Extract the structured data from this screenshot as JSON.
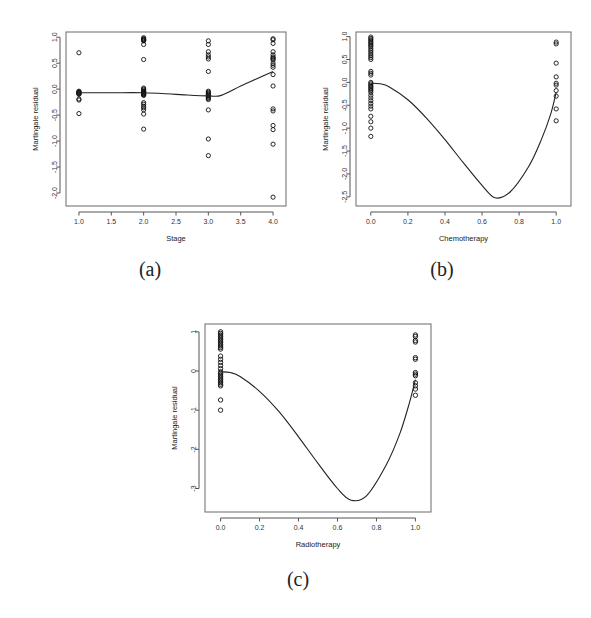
{
  "figure": {
    "background": "#ffffff",
    "panel_captions": [
      "(a)",
      "(b)",
      "(c)"
    ],
    "y_axis_label": "Martingale residual"
  },
  "chart_data": [
    {
      "type": "scatter",
      "panel": "(a)",
      "title": "",
      "xlabel": "Stage",
      "ylabel": "Martingale residual",
      "xlim": [
        0.8,
        4.2
      ],
      "ylim": [
        -2.25,
        1.1
      ],
      "xticks": [
        1.0,
        1.5,
        2.0,
        2.5,
        3.0,
        3.5,
        4.0
      ],
      "xticklabels": [
        "1.0",
        "1.5",
        "2.0",
        "2.5",
        "3.0",
        "3.5",
        "4.0"
      ],
      "yticks": [
        1.0,
        0.5,
        0.0,
        -0.5,
        -1.0,
        -1.5,
        -2.0
      ],
      "yticklabels": [
        "1.0",
        "0.5",
        "0.0",
        "-0.5",
        "-1.0",
        "-1.5",
        "-2.0"
      ],
      "grid": false,
      "legend": "none",
      "points": [
        {
          "x": 1.0,
          "y": 0.7
        },
        {
          "x": 1.0,
          "y": -0.04
        },
        {
          "x": 1.0,
          "y": -0.05
        },
        {
          "x": 1.0,
          "y": -0.06
        },
        {
          "x": 1.0,
          "y": -0.07
        },
        {
          "x": 1.0,
          "y": -0.08
        },
        {
          "x": 1.0,
          "y": -0.09
        },
        {
          "x": 1.0,
          "y": -0.1
        },
        {
          "x": 1.0,
          "y": -0.19
        },
        {
          "x": 1.0,
          "y": -0.21
        },
        {
          "x": 1.0,
          "y": -0.47
        },
        {
          "x": 2.0,
          "y": 0.99
        },
        {
          "x": 2.0,
          "y": 0.97
        },
        {
          "x": 2.0,
          "y": 0.96
        },
        {
          "x": 2.0,
          "y": 0.95
        },
        {
          "x": 2.0,
          "y": 0.94
        },
        {
          "x": 2.0,
          "y": 0.93
        },
        {
          "x": 2.0,
          "y": 0.86
        },
        {
          "x": 2.0,
          "y": 0.57
        },
        {
          "x": 2.0,
          "y": 0.02
        },
        {
          "x": 2.0,
          "y": 0.0
        },
        {
          "x": 2.0,
          "y": -0.02
        },
        {
          "x": 2.0,
          "y": -0.04
        },
        {
          "x": 2.0,
          "y": -0.05
        },
        {
          "x": 2.0,
          "y": -0.06
        },
        {
          "x": 2.0,
          "y": -0.07
        },
        {
          "x": 2.0,
          "y": -0.08
        },
        {
          "x": 2.0,
          "y": -0.09
        },
        {
          "x": 2.0,
          "y": -0.1
        },
        {
          "x": 2.0,
          "y": -0.11
        },
        {
          "x": 2.0,
          "y": -0.12
        },
        {
          "x": 2.0,
          "y": -0.26
        },
        {
          "x": 2.0,
          "y": -0.29
        },
        {
          "x": 2.0,
          "y": -0.33
        },
        {
          "x": 2.0,
          "y": -0.36
        },
        {
          "x": 2.0,
          "y": -0.4
        },
        {
          "x": 2.0,
          "y": -0.48
        },
        {
          "x": 2.0,
          "y": -0.77
        },
        {
          "x": 3.0,
          "y": 0.93
        },
        {
          "x": 3.0,
          "y": 0.86
        },
        {
          "x": 3.0,
          "y": 0.72
        },
        {
          "x": 3.0,
          "y": 0.66
        },
        {
          "x": 3.0,
          "y": 0.62
        },
        {
          "x": 3.0,
          "y": 0.58
        },
        {
          "x": 3.0,
          "y": 0.34
        },
        {
          "x": 3.0,
          "y": -0.04
        },
        {
          "x": 3.0,
          "y": -0.06
        },
        {
          "x": 3.0,
          "y": -0.08
        },
        {
          "x": 3.0,
          "y": -0.1
        },
        {
          "x": 3.0,
          "y": -0.12
        },
        {
          "x": 3.0,
          "y": -0.14
        },
        {
          "x": 3.0,
          "y": -0.16
        },
        {
          "x": 3.0,
          "y": -0.18
        },
        {
          "x": 3.0,
          "y": -0.2
        },
        {
          "x": 3.0,
          "y": -0.4
        },
        {
          "x": 3.0,
          "y": -0.96
        },
        {
          "x": 3.0,
          "y": -1.28
        },
        {
          "x": 4.0,
          "y": 0.97
        },
        {
          "x": 4.0,
          "y": 0.95
        },
        {
          "x": 4.0,
          "y": 0.88
        },
        {
          "x": 4.0,
          "y": 0.72
        },
        {
          "x": 4.0,
          "y": 0.66
        },
        {
          "x": 4.0,
          "y": 0.62
        },
        {
          "x": 4.0,
          "y": 0.6
        },
        {
          "x": 4.0,
          "y": 0.58
        },
        {
          "x": 4.0,
          "y": 0.56
        },
        {
          "x": 4.0,
          "y": 0.5
        },
        {
          "x": 4.0,
          "y": 0.46
        },
        {
          "x": 4.0,
          "y": 0.42
        },
        {
          "x": 4.0,
          "y": 0.28
        },
        {
          "x": 4.0,
          "y": 0.06
        },
        {
          "x": 4.0,
          "y": -0.38
        },
        {
          "x": 4.0,
          "y": -0.42
        },
        {
          "x": 4.0,
          "y": -0.7
        },
        {
          "x": 4.0,
          "y": -0.78
        },
        {
          "x": 4.0,
          "y": -1.06
        },
        {
          "x": 4.0,
          "y": -2.08
        }
      ],
      "smooth_line": [
        {
          "x": 1.0,
          "y": -0.07
        },
        {
          "x": 1.5,
          "y": -0.07
        },
        {
          "x": 2.0,
          "y": -0.07
        },
        {
          "x": 2.5,
          "y": -0.1
        },
        {
          "x": 3.0,
          "y": -0.13
        },
        {
          "x": 3.2,
          "y": -0.12
        },
        {
          "x": 3.5,
          "y": 0.06
        },
        {
          "x": 3.75,
          "y": 0.2
        },
        {
          "x": 4.0,
          "y": 0.34
        }
      ]
    },
    {
      "type": "scatter",
      "panel": "(b)",
      "title": "",
      "xlabel": "Chemotherapy",
      "ylabel": "Martingale residual",
      "xlim": [
        -0.08,
        1.08
      ],
      "ylim": [
        -2.7,
        1.1
      ],
      "xticks": [
        0.0,
        0.2,
        0.4,
        0.6,
        0.8,
        1.0
      ],
      "xticklabels": [
        "0.0",
        "0.2",
        "0.4",
        "0.6",
        "0.8",
        "1.0"
      ],
      "yticks": [
        1.0,
        0.5,
        0.0,
        -0.5,
        -1.0,
        -1.5,
        -2.0,
        -2.5
      ],
      "yticklabels": [
        "1.0",
        "0.5",
        "0.0",
        "-0.5",
        "-1.0",
        "-1.5",
        "-2.0",
        "-2.5"
      ],
      "grid": false,
      "legend": "none",
      "points": [
        {
          "x": 0.0,
          "y": 0.99
        },
        {
          "x": 0.0,
          "y": 0.96
        },
        {
          "x": 0.0,
          "y": 0.93
        },
        {
          "x": 0.0,
          "y": 0.9
        },
        {
          "x": 0.0,
          "y": 0.87
        },
        {
          "x": 0.0,
          "y": 0.84
        },
        {
          "x": 0.0,
          "y": 0.81
        },
        {
          "x": 0.0,
          "y": 0.78
        },
        {
          "x": 0.0,
          "y": 0.74
        },
        {
          "x": 0.0,
          "y": 0.7
        },
        {
          "x": 0.0,
          "y": 0.66
        },
        {
          "x": 0.0,
          "y": 0.62
        },
        {
          "x": 0.0,
          "y": 0.58
        },
        {
          "x": 0.0,
          "y": 0.54
        },
        {
          "x": 0.0,
          "y": 0.5
        },
        {
          "x": 0.0,
          "y": 0.24
        },
        {
          "x": 0.0,
          "y": 0.2
        },
        {
          "x": 0.0,
          "y": 0.16
        },
        {
          "x": 0.0,
          "y": 0.0
        },
        {
          "x": 0.0,
          "y": -0.03
        },
        {
          "x": 0.0,
          "y": -0.06
        },
        {
          "x": 0.0,
          "y": -0.09
        },
        {
          "x": 0.0,
          "y": -0.12
        },
        {
          "x": 0.0,
          "y": -0.15
        },
        {
          "x": 0.0,
          "y": -0.18
        },
        {
          "x": 0.0,
          "y": -0.22
        },
        {
          "x": 0.0,
          "y": -0.28
        },
        {
          "x": 0.0,
          "y": -0.34
        },
        {
          "x": 0.0,
          "y": -0.4
        },
        {
          "x": 0.0,
          "y": -0.46
        },
        {
          "x": 0.0,
          "y": -0.52
        },
        {
          "x": 0.0,
          "y": -0.58
        },
        {
          "x": 0.0,
          "y": -0.74
        },
        {
          "x": 0.0,
          "y": -0.86
        },
        {
          "x": 0.0,
          "y": -1.0
        },
        {
          "x": 0.0,
          "y": -1.18
        },
        {
          "x": 1.0,
          "y": 0.88
        },
        {
          "x": 1.0,
          "y": 0.84
        },
        {
          "x": 1.0,
          "y": 0.42
        },
        {
          "x": 1.0,
          "y": 0.12
        },
        {
          "x": 1.0,
          "y": -0.02
        },
        {
          "x": 1.0,
          "y": -0.06
        },
        {
          "x": 1.0,
          "y": -0.18
        },
        {
          "x": 1.0,
          "y": -0.3
        },
        {
          "x": 1.0,
          "y": -0.58
        },
        {
          "x": 1.0,
          "y": -0.84
        }
      ],
      "smooth_line": [
        {
          "x": 0.0,
          "y": -0.02
        },
        {
          "x": 0.05,
          "y": -0.03
        },
        {
          "x": 0.1,
          "y": -0.1
        },
        {
          "x": 0.2,
          "y": -0.38
        },
        {
          "x": 0.3,
          "y": -0.78
        },
        {
          "x": 0.4,
          "y": -1.25
        },
        {
          "x": 0.5,
          "y": -1.76
        },
        {
          "x": 0.6,
          "y": -2.25
        },
        {
          "x": 0.67,
          "y": -2.52
        },
        {
          "x": 0.75,
          "y": -2.4
        },
        {
          "x": 0.85,
          "y": -1.85
        },
        {
          "x": 0.92,
          "y": -1.25
        },
        {
          "x": 0.97,
          "y": -0.7
        },
        {
          "x": 1.0,
          "y": -0.22
        }
      ]
    },
    {
      "type": "scatter",
      "panel": "(c)",
      "title": "",
      "xlabel": "Radiotherapy",
      "ylabel": "Martingale residual",
      "xlim": [
        -0.08,
        1.08
      ],
      "ylim": [
        -3.6,
        1.2
      ],
      "xticks": [
        0.0,
        0.2,
        0.4,
        0.6,
        0.8,
        1.0
      ],
      "xticklabels": [
        "0.0",
        "0.2",
        "0.4",
        "0.6",
        "0.8",
        "1.0"
      ],
      "yticks": [
        1,
        0,
        -1,
        -2,
        -3
      ],
      "yticklabels": [
        "1",
        "0",
        "-1",
        "-2",
        "-3"
      ],
      "grid": false,
      "legend": "none",
      "points": [
        {
          "x": 0.0,
          "y": 1.0
        },
        {
          "x": 0.0,
          "y": 0.96
        },
        {
          "x": 0.0,
          "y": 0.92
        },
        {
          "x": 0.0,
          "y": 0.88
        },
        {
          "x": 0.0,
          "y": 0.84
        },
        {
          "x": 0.0,
          "y": 0.8
        },
        {
          "x": 0.0,
          "y": 0.76
        },
        {
          "x": 0.0,
          "y": 0.72
        },
        {
          "x": 0.0,
          "y": 0.68
        },
        {
          "x": 0.0,
          "y": 0.64
        },
        {
          "x": 0.0,
          "y": 0.6
        },
        {
          "x": 0.0,
          "y": 0.56
        },
        {
          "x": 0.0,
          "y": 0.38
        },
        {
          "x": 0.0,
          "y": 0.3
        },
        {
          "x": 0.0,
          "y": 0.22
        },
        {
          "x": 0.0,
          "y": 0.14
        },
        {
          "x": 0.0,
          "y": 0.06
        },
        {
          "x": 0.0,
          "y": -0.02
        },
        {
          "x": 0.0,
          "y": -0.06
        },
        {
          "x": 0.0,
          "y": -0.1
        },
        {
          "x": 0.0,
          "y": -0.14
        },
        {
          "x": 0.0,
          "y": -0.18
        },
        {
          "x": 0.0,
          "y": -0.22
        },
        {
          "x": 0.0,
          "y": -0.26
        },
        {
          "x": 0.0,
          "y": -0.3
        },
        {
          "x": 0.0,
          "y": -0.34
        },
        {
          "x": 0.0,
          "y": -0.38
        },
        {
          "x": 0.0,
          "y": -0.74
        },
        {
          "x": 0.0,
          "y": -1.0
        },
        {
          "x": 1.0,
          "y": 0.92
        },
        {
          "x": 1.0,
          "y": 0.88
        },
        {
          "x": 1.0,
          "y": 0.78
        },
        {
          "x": 1.0,
          "y": 0.74
        },
        {
          "x": 1.0,
          "y": 0.34
        },
        {
          "x": 1.0,
          "y": 0.3
        },
        {
          "x": 1.0,
          "y": -0.04
        },
        {
          "x": 1.0,
          "y": -0.08
        },
        {
          "x": 1.0,
          "y": -0.12
        },
        {
          "x": 1.0,
          "y": -0.3
        },
        {
          "x": 1.0,
          "y": -0.38
        },
        {
          "x": 1.0,
          "y": -0.46
        },
        {
          "x": 1.0,
          "y": -0.62
        }
      ],
      "smooth_line": [
        {
          "x": 0.0,
          "y": -0.02
        },
        {
          "x": 0.05,
          "y": -0.04
        },
        {
          "x": 0.1,
          "y": -0.14
        },
        {
          "x": 0.2,
          "y": -0.52
        },
        {
          "x": 0.3,
          "y": -1.04
        },
        {
          "x": 0.4,
          "y": -1.68
        },
        {
          "x": 0.5,
          "y": -2.36
        },
        {
          "x": 0.6,
          "y": -3.0
        },
        {
          "x": 0.67,
          "y": -3.3
        },
        {
          "x": 0.75,
          "y": -3.18
        },
        {
          "x": 0.85,
          "y": -2.4
        },
        {
          "x": 0.92,
          "y": -1.6
        },
        {
          "x": 0.97,
          "y": -0.8
        },
        {
          "x": 1.0,
          "y": -0.22
        }
      ]
    }
  ]
}
